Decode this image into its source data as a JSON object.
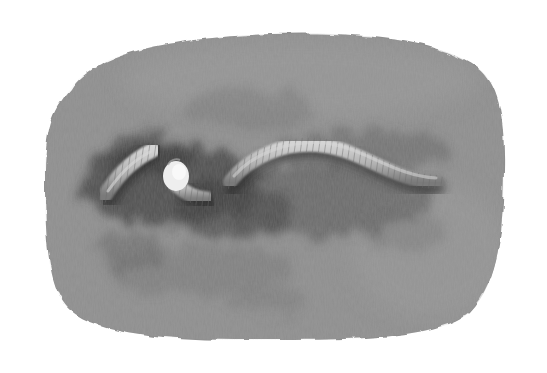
{
  "image": {
    "subject": "earthworm illustration",
    "description": "Grayscale painted illustration of an earthworm, apparently cut in two, lying on a rounded rectangular textured gray patch with dark soil smudges",
    "colors": {
      "background": "#ffffff",
      "patch_base": "#8f8f8f",
      "patch_light": "#9a9a9a",
      "smudge_dark": "#3c3c3c",
      "worm_body": "#b8b8b8",
      "worm_highlight": "#d6d6d6",
      "worm_shadow": "#6e6e6e",
      "cut_end": "#f2f2f2"
    },
    "elements": [
      {
        "name": "background-patch",
        "bounds": [
          45,
          30,
          505,
          342
        ]
      },
      {
        "name": "worm-head-segment",
        "bounds": [
          100,
          145,
          155,
          200
        ]
      },
      {
        "name": "worm-cut-end",
        "bounds": [
          162,
          160,
          190,
          192
        ]
      },
      {
        "name": "worm-middle-segment",
        "bounds": [
          170,
          160,
          210,
          205
        ]
      },
      {
        "name": "worm-tail-segment",
        "bounds": [
          225,
          140,
          440,
          195
        ]
      }
    ]
  }
}
